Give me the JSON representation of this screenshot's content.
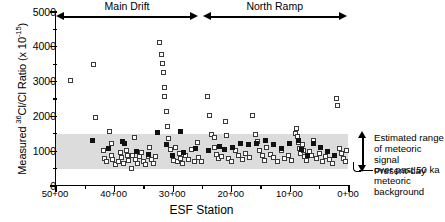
{
  "chart_data": {
    "type": "scatter",
    "title": "",
    "xlabel": "ESF Station",
    "ylabel_html": "Measured <sup>36</sup>Cl/Cl Ratio (x 10<sup>-15</sup>)",
    "ylabel_text": "Measured 36Cl/Cl Ratio (x 10-15)",
    "xlim": [
      5000,
      0
    ],
    "ylim": [
      0,
      5000
    ],
    "x_ticks": [
      "50+00",
      "40+00",
      "30+00",
      "20+00",
      "10+00",
      "0+00"
    ],
    "x_tick_values": [
      5000,
      4000,
      3000,
      2000,
      1000,
      0
    ],
    "x_minor_interval": 500,
    "y_ticks": [
      "0",
      "1000",
      "2000",
      "3000",
      "4000",
      "5000"
    ],
    "y_tick_values": [
      0,
      1000,
      2000,
      3000,
      4000,
      5000
    ],
    "y_minor_interval": 500,
    "grid": false,
    "legend_position": "none",
    "shaded_band": {
      "label": "Estimated range of meteoric signal over past 50 ka",
      "ymin": 480,
      "ymax": 1480,
      "color": "#dcdcdc"
    },
    "baseline_marker": {
      "label": "Present-day meteoric background",
      "y": 500
    },
    "range_arrows": [
      {
        "label": "Main Drift",
        "x_start": 4980,
        "x_end": 2560
      },
      {
        "label": "North Ramp",
        "x_start": 2480,
        "x_end": 20
      }
    ],
    "series": [
      {
        "name": "open-square",
        "marker": "open square",
        "points": [
          [
            4760,
            3040
          ],
          [
            4360,
            3480
          ],
          [
            4330,
            1960
          ],
          [
            4190,
            1020
          ],
          [
            4180,
            790
          ],
          [
            4130,
            690
          ],
          [
            4090,
            1560
          ],
          [
            4060,
            1230
          ],
          [
            4050,
            880
          ],
          [
            4030,
            760
          ],
          [
            3990,
            620
          ],
          [
            3930,
            700
          ],
          [
            3900,
            960
          ],
          [
            3880,
            830
          ],
          [
            3840,
            640
          ],
          [
            3800,
            1010
          ],
          [
            3780,
            880
          ],
          [
            3760,
            720
          ],
          [
            3720,
            500
          ],
          [
            3700,
            880
          ],
          [
            3660,
            1390
          ],
          [
            3640,
            760
          ],
          [
            3610,
            660
          ],
          [
            3580,
            840
          ],
          [
            3540,
            950
          ],
          [
            3510,
            700
          ],
          [
            3470,
            630
          ],
          [
            3430,
            860
          ],
          [
            3400,
            1100
          ],
          [
            3370,
            760
          ],
          [
            3330,
            650
          ],
          [
            3300,
            840
          ],
          [
            3230,
            4110
          ],
          [
            3200,
            3790
          ],
          [
            3180,
            3510
          ],
          [
            3160,
            3250
          ],
          [
            3150,
            2830
          ],
          [
            3140,
            2560
          ],
          [
            3120,
            2140
          ],
          [
            3100,
            1700
          ],
          [
            3080,
            1370
          ],
          [
            3050,
            1050
          ],
          [
            3020,
            880
          ],
          [
            2990,
            740
          ],
          [
            2960,
            1110
          ],
          [
            2930,
            690
          ],
          [
            2900,
            930
          ],
          [
            2870,
            800
          ],
          [
            2840,
            660
          ],
          [
            2790,
            870
          ],
          [
            2740,
            760
          ],
          [
            2690,
            1040
          ],
          [
            2640,
            690
          ],
          [
            2590,
            1250
          ],
          [
            2560,
            820
          ],
          [
            2510,
            700
          ],
          [
            2420,
            2560
          ],
          [
            2380,
            2020
          ],
          [
            2340,
            1470
          ],
          [
            2300,
            1120
          ],
          [
            2290,
            1390
          ],
          [
            2260,
            900
          ],
          [
            2230,
            780
          ],
          [
            2180,
            840
          ],
          [
            2110,
            1860
          ],
          [
            2090,
            1450
          ],
          [
            2050,
            780
          ],
          [
            2000,
            700
          ],
          [
            1940,
            1010
          ],
          [
            1880,
            870
          ],
          [
            1820,
            760
          ],
          [
            1760,
            940
          ],
          [
            1700,
            830
          ],
          [
            1640,
            2030
          ],
          [
            1600,
            1480
          ],
          [
            1560,
            1270
          ],
          [
            1520,
            1010
          ],
          [
            1480,
            880
          ],
          [
            1440,
            740
          ],
          [
            1400,
            1100
          ],
          [
            1340,
            900
          ],
          [
            1280,
            830
          ],
          [
            1220,
            690
          ],
          [
            1160,
            1010
          ],
          [
            1100,
            780
          ],
          [
            1040,
            870
          ],
          [
            980,
            740
          ],
          [
            920,
            1520
          ],
          [
            900,
            1660
          ],
          [
            880,
            1430
          ],
          [
            860,
            1250
          ],
          [
            840,
            1090
          ],
          [
            820,
            940
          ],
          [
            800,
            1180
          ],
          [
            780,
            1020
          ],
          [
            760,
            860
          ],
          [
            720,
            740
          ],
          [
            680,
            980
          ],
          [
            640,
            870
          ],
          [
            600,
            1300
          ],
          [
            560,
            790
          ],
          [
            500,
            930
          ],
          [
            460,
            700
          ],
          [
            400,
            850
          ],
          [
            340,
            760
          ],
          [
            280,
            640
          ],
          [
            220,
            2520
          ],
          [
            200,
            2300
          ],
          [
            170,
            1080
          ],
          [
            130,
            930
          ],
          [
            90,
            800
          ],
          [
            60,
            700
          ],
          [
            40,
            1030
          ]
        ]
      },
      {
        "name": "filled-square",
        "marker": "filled square",
        "points": [
          [
            4380,
            1300
          ],
          [
            4100,
            1070
          ],
          [
            3870,
            1290
          ],
          [
            3830,
            1220
          ],
          [
            3620,
            1000
          ],
          [
            3420,
            910
          ],
          [
            3260,
            1550
          ],
          [
            3110,
            1180
          ],
          [
            3010,
            870
          ],
          [
            2880,
            1560
          ],
          [
            2820,
            960
          ],
          [
            2620,
            1090
          ],
          [
            2400,
            1010
          ],
          [
            2210,
            1130
          ],
          [
            2130,
            1040
          ],
          [
            1990,
            1110
          ],
          [
            1850,
            1220
          ],
          [
            1710,
            1180
          ],
          [
            1570,
            1230
          ],
          [
            1430,
            1300
          ],
          [
            1290,
            1180
          ],
          [
            1150,
            1080
          ],
          [
            1010,
            1210
          ],
          [
            870,
            1310
          ],
          [
            810,
            1040
          ],
          [
            700,
            890
          ],
          [
            610,
            1230
          ],
          [
            480,
            1120
          ],
          [
            360,
            980
          ],
          [
            250,
            880
          ]
        ]
      }
    ]
  },
  "annotations": {
    "band_label_lines": [
      "Estimated range",
      "of meteoric signal",
      "over past 50 ka"
    ],
    "baseline_label_lines": [
      "Present-day",
      "meteoric",
      "background"
    ]
  }
}
